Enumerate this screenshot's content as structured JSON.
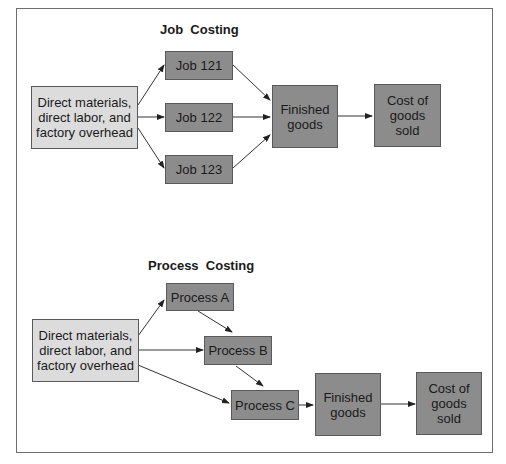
{
  "job_costing": {
    "title": "Job  Costing",
    "inputs": "Direct materials, direct labor, and factory overhead",
    "jobs": [
      "Job 121",
      "Job 122",
      "Job 123"
    ],
    "finished_goods": "Finished goods",
    "cost_of_goods_sold": "Cost of goods sold"
  },
  "process_costing": {
    "title": "Process  Costing",
    "inputs": "Direct materials, direct labor, and factory overhead",
    "processes": [
      "Process A",
      "Process B",
      "Process C"
    ],
    "finished_goods": "Finished goods",
    "cost_of_goods_sold": "Cost of goods sold"
  },
  "colors": {
    "input_box": "#dcdcdc",
    "stage_box": "#8c8c8c",
    "border": "#6e6e6e"
  }
}
